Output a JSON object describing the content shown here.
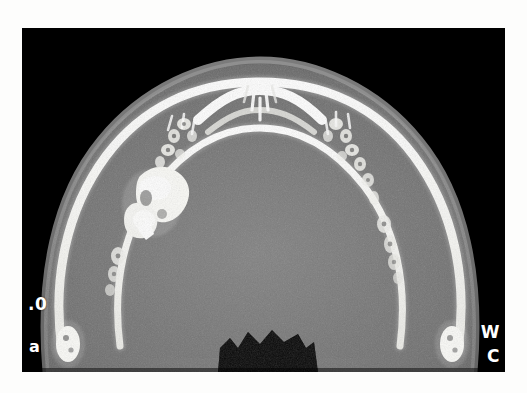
{
  "figure": {
    "panel_label": "a",
    "modality": "CT",
    "view": "axial",
    "anatomy": "mandible"
  },
  "image": {
    "frame": {
      "x": 22,
      "y": 28,
      "width": 483,
      "height": 344
    },
    "background_color": "#000000",
    "page_color": "#ffffff"
  },
  "annotations": {
    "scale_value": ".0",
    "window_label": "W",
    "center_label": "C"
  },
  "palette": {
    "air_black": "#000000",
    "soft_tissue_gray": "#7d7d7d",
    "soft_tissue_dark": "#5c5c5c",
    "marrow_gray": "#6a6a6a",
    "cortical_bone_white": "#ffffff",
    "bone_bright": "#f4f4f0",
    "lesion_white": "#fafaf6",
    "airway_black": "#050505",
    "text_white": "#ffffff"
  },
  "ct_scene": {
    "description": "Axial CT slice through the mandible showing a horseshoe-shaped arch of hyperdense cortical bone surrounded by gray soft tissue, with black air background and a star-shaped oropharyngeal airway at the lower midline.",
    "soft_tissue_outline": "M 104 344 C 96 250 112 170 158 114 C 200 62 262 36 318 36 C 374 36 436 62 478 114 C 524 170 540 250 532 344 Z",
    "mandible_outer_arch": "M 116 330 C 104 258 120 186 162 130 C 200 80 252 54 318 54 C 384 54 436 80 474 130 C 516 186 532 258 520 330",
    "mandible_inner_arch": "M 176 324 C 168 260 180 202 214 158 C 246 118 282 100 318 100 C 354 100 390 118 422 158 C 456 202 468 260 460 324",
    "airway_polygon": "M 232 344 L 236 314 L 248 306 L 258 316 L 272 300 L 286 312 L 300 302 L 316 312 L 330 304 L 340 318 L 344 344 Z",
    "lesion": {
      "side": "left",
      "center_x": 160,
      "center_y": 160,
      "label": "expansile-hyperdense-lesion"
    },
    "tooth_roots_left": [
      {
        "x": 196,
        "y": 92
      },
      {
        "x": 206,
        "y": 104
      },
      {
        "x": 214,
        "y": 120
      },
      {
        "x": 186,
        "y": 112
      },
      {
        "x": 178,
        "y": 130
      },
      {
        "x": 168,
        "y": 146
      },
      {
        "x": 152,
        "y": 176
      },
      {
        "x": 144,
        "y": 196
      },
      {
        "x": 138,
        "y": 226
      },
      {
        "x": 132,
        "y": 252
      }
    ],
    "tooth_roots_right": [
      {
        "x": 440,
        "y": 92
      },
      {
        "x": 430,
        "y": 104
      },
      {
        "x": 422,
        "y": 120
      },
      {
        "x": 450,
        "y": 112
      },
      {
        "x": 458,
        "y": 130
      },
      {
        "x": 466,
        "y": 146
      },
      {
        "x": 480,
        "y": 176
      },
      {
        "x": 488,
        "y": 196
      },
      {
        "x": 494,
        "y": 226
      },
      {
        "x": 500,
        "y": 252
      }
    ],
    "incisor_roots_midline": [
      {
        "x": 312,
        "y": 44
      },
      {
        "x": 324,
        "y": 44
      },
      {
        "x": 318,
        "y": 62
      }
    ],
    "ramus_tip_left": {
      "x": 122,
      "y": 320
    },
    "ramus_tip_right": {
      "x": 514,
      "y": 320
    }
  }
}
